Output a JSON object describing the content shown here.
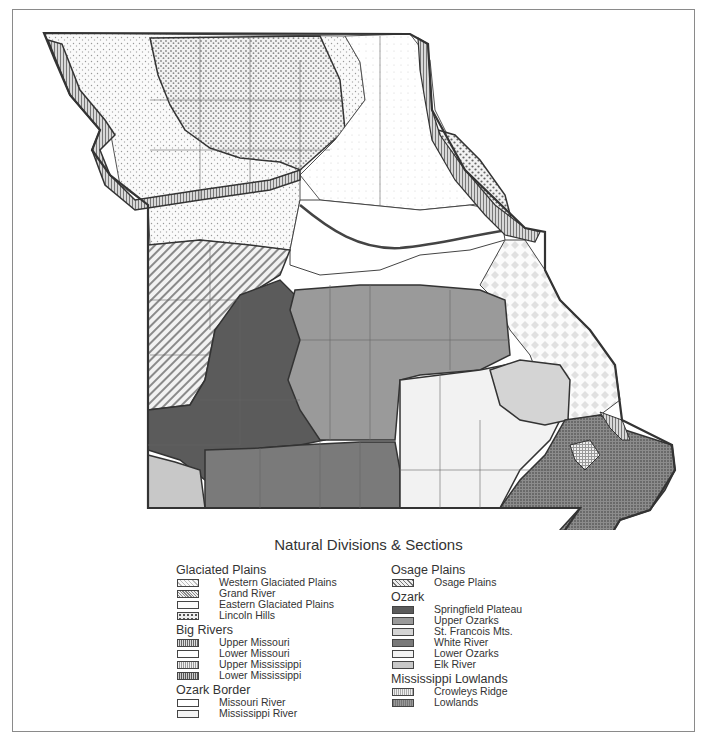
{
  "legend": {
    "title": "Natural Divisions & Sections",
    "groups": [
      {
        "name": "Glaciated Plains",
        "items": [
          {
            "label": "Western Glaciated Plains",
            "pattern": "light-stipple"
          },
          {
            "label": "Grand River",
            "pattern": "dense-stipple"
          },
          {
            "label": "Eastern Glaciated Plains",
            "pattern": "faint-stipple"
          },
          {
            "label": "Lincoln Hills",
            "pattern": "dots"
          }
        ]
      },
      {
        "name": "Big Rivers",
        "items": [
          {
            "label": "Upper Missouri",
            "pattern": "vertical-lines"
          },
          {
            "label": "Lower Missouri",
            "pattern": "blank"
          },
          {
            "label": "Upper Mississippi",
            "pattern": "vertical-lines-light"
          },
          {
            "label": "Lower Mississippi",
            "pattern": "vertical-lines-dark"
          }
        ]
      },
      {
        "name": "Ozark Border",
        "items": [
          {
            "label": "Missouri River",
            "pattern": "blank"
          },
          {
            "label": "Mississippi River",
            "pattern": "diamond"
          }
        ]
      },
      {
        "name": "Osage Plains",
        "items": [
          {
            "label": "Osage Plains",
            "pattern": "diagonal-hatch"
          }
        ]
      },
      {
        "name": "Ozark",
        "items": [
          {
            "label": "Springfield Plateau",
            "color": "#5b5b5b"
          },
          {
            "label": "Upper Ozarks",
            "color": "#9a9a9a"
          },
          {
            "label": "St. Francois Mts.",
            "color": "#d4d4d4"
          },
          {
            "label": "White River",
            "color": "#7a7a7a"
          },
          {
            "label": "Lower Ozarks",
            "color": "#f2f2f2"
          },
          {
            "label": "Elk River",
            "color": "#c8c8c8"
          }
        ]
      },
      {
        "name": "Mississippi Lowlands",
        "items": [
          {
            "label": "Crowleys Ridge",
            "pattern": "grid-light"
          },
          {
            "label": "Lowlands",
            "pattern": "grid-dark"
          }
        ]
      }
    ]
  },
  "colors": {
    "springfield_plateau": "#5b5b5b",
    "upper_ozarks": "#9a9a9a",
    "st_francois": "#d4d4d4",
    "white_river": "#7a7a7a",
    "lower_ozarks": "#f2f2f2",
    "elk_river": "#c8c8c8",
    "outline": "#333333"
  }
}
